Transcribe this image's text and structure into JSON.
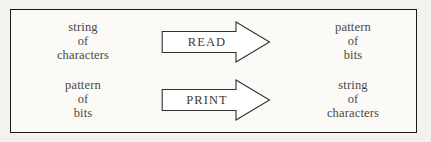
{
  "figure": {
    "background_color": "#f3f2ee",
    "panel_color": "#fbfaf7",
    "border_color": "#1b1b1b",
    "text_color": "#4a4845",
    "rows": [
      {
        "name": "read",
        "input": {
          "line1": "string",
          "line2": "of",
          "line3": "characters"
        },
        "arrow": {
          "label": "READ",
          "direction": "right"
        },
        "output": {
          "line1": "pattern",
          "line2": "of",
          "line3": "bits"
        }
      },
      {
        "name": "print",
        "input": {
          "line1": "pattern",
          "line2": "of",
          "line3": "bits"
        },
        "arrow": {
          "label": "PRINT",
          "direction": "right"
        },
        "output": {
          "line1": "string",
          "line2": "of",
          "line3": "characters"
        }
      }
    ]
  }
}
